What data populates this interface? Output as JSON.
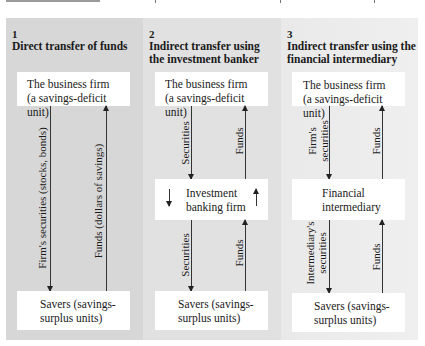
{
  "figure": {
    "panels": [
      {
        "number": "1",
        "title": "Direct transfer of funds",
        "top_box": [
          "The business firm",
          "(a savings-deficit unit)"
        ],
        "bottom_box": [
          "Savers (savings-",
          "surplus units)"
        ],
        "down_label": "Firm's securities (stocks, bonds)",
        "up_label": "Funds (dollars of savings)"
      },
      {
        "number": "2",
        "title_lines": [
          "Indirect transfer using",
          "the investment banker"
        ],
        "top_box": [
          "The business firm",
          "(a savings-deficit unit)"
        ],
        "middle_box": [
          "Investment",
          "banking firm"
        ],
        "bottom_box": [
          "Savers (savings-",
          "surplus units)"
        ],
        "upper_down_label": "Securities",
        "upper_up_label": "Funds",
        "lower_down_label": "Securities",
        "lower_up_label": "Funds"
      },
      {
        "number": "3",
        "title_lines": [
          "Indirect transfer using the",
          "financial intermediary"
        ],
        "top_box": [
          "The business firm",
          "(a savings-deficit unit)"
        ],
        "middle_box": [
          "Financial",
          "intermediary"
        ],
        "bottom_box": [
          "Savers (savings-",
          "surplus units)"
        ],
        "upper_down_label": [
          "Firm's",
          "securities"
        ],
        "upper_up_label": "Funds",
        "lower_down_label": [
          "Intermediary's",
          "securities"
        ],
        "lower_up_label": "Funds"
      }
    ],
    "colors": {
      "panel1_bg": "#d7d7d7",
      "panel2_bg": "#e1e1e1",
      "panel3_bg": "#ebebeb",
      "box_bg": "#ffffff",
      "arrow": "#222222"
    }
  }
}
